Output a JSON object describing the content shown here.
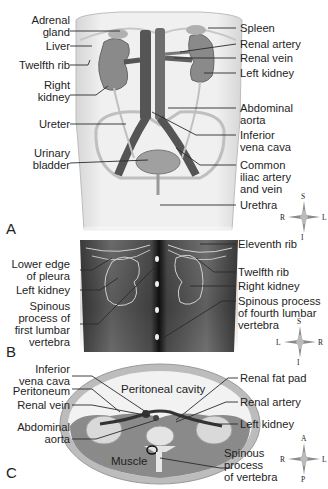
{
  "panels": {
    "A": {
      "letter": "A",
      "labels_left": [
        {
          "id": "adrenal-gland",
          "lines": [
            "Adrenal",
            "gland"
          ]
        },
        {
          "id": "liver",
          "lines": [
            "Liver"
          ]
        },
        {
          "id": "twelfth-rib",
          "lines": [
            "Twelfth rib"
          ]
        },
        {
          "id": "right-kidney",
          "lines": [
            "Right",
            "kidney"
          ]
        },
        {
          "id": "ureter",
          "lines": [
            "Ureter"
          ]
        },
        {
          "id": "urinary-bladder",
          "lines": [
            "Urinary",
            "bladder"
          ]
        }
      ],
      "labels_right": [
        {
          "id": "spleen",
          "lines": [
            "Spleen"
          ]
        },
        {
          "id": "renal-artery",
          "lines": [
            "Renal artery"
          ]
        },
        {
          "id": "renal-vein",
          "lines": [
            "Renal vein"
          ]
        },
        {
          "id": "left-kidney",
          "lines": [
            "Left kidney"
          ]
        },
        {
          "id": "abdominal-aorta",
          "lines": [
            "Abdominal",
            "aorta"
          ]
        },
        {
          "id": "inferior-vena-cava",
          "lines": [
            "Inferior",
            "vena cava"
          ]
        },
        {
          "id": "common-iliac",
          "lines": [
            "Common",
            "iliac artery",
            "and vein"
          ]
        },
        {
          "id": "urethra",
          "lines": [
            "Urethra"
          ]
        }
      ],
      "compass": {
        "top": "S",
        "bottom": "I",
        "left": "R",
        "right": "L"
      }
    },
    "B": {
      "letter": "B",
      "labels_left": [
        {
          "id": "lower-edge-pleura",
          "lines": [
            "Lower edge",
            "of pleura"
          ]
        },
        {
          "id": "left-kidney-b",
          "lines": [
            "Left kidney"
          ]
        },
        {
          "id": "spinous-first-lumbar",
          "lines": [
            "Spinous",
            "process of",
            "first lumbar",
            "vertebra"
          ]
        }
      ],
      "labels_right": [
        {
          "id": "eleventh-rib",
          "lines": [
            "Eleventh rib"
          ]
        },
        {
          "id": "twelfth-rib-b",
          "lines": [
            "Twelfth rib"
          ]
        },
        {
          "id": "right-kidney-b",
          "lines": [
            "Right kidney"
          ]
        },
        {
          "id": "spinous-fourth-lumbar",
          "lines": [
            "Spinous process",
            "of fourth lumbar",
            "vertebra"
          ]
        }
      ],
      "compass": {
        "top": "S",
        "bottom": "I",
        "left": "L",
        "right": "R"
      }
    },
    "C": {
      "letter": "C",
      "labels_left": [
        {
          "id": "ivc-c",
          "lines": [
            "Inferior",
            "vena cava"
          ]
        },
        {
          "id": "peritoneum",
          "lines": [
            "Peritoneum"
          ]
        },
        {
          "id": "renal-vein-c",
          "lines": [
            "Renal vein"
          ]
        },
        {
          "id": "abdominal-aorta-c",
          "lines": [
            "Abdominal",
            "aorta"
          ]
        }
      ],
      "labels_right": [
        {
          "id": "renal-fat-pad",
          "lines": [
            "Renal fat pad"
          ]
        },
        {
          "id": "renal-artery-c",
          "lines": [
            "Renal artery"
          ]
        },
        {
          "id": "left-kidney-c",
          "lines": [
            "Left kidney"
          ]
        },
        {
          "id": "spinous-process-vertebra",
          "lines": [
            "Spinous",
            "process",
            "of vertebra"
          ]
        }
      ],
      "inner_labels": {
        "peritoneal_cavity": "Peritoneal cavity",
        "muscle": "Muscle"
      },
      "compass": {
        "top": "A",
        "bottom": "P",
        "left": "R",
        "right": "L"
      }
    }
  }
}
